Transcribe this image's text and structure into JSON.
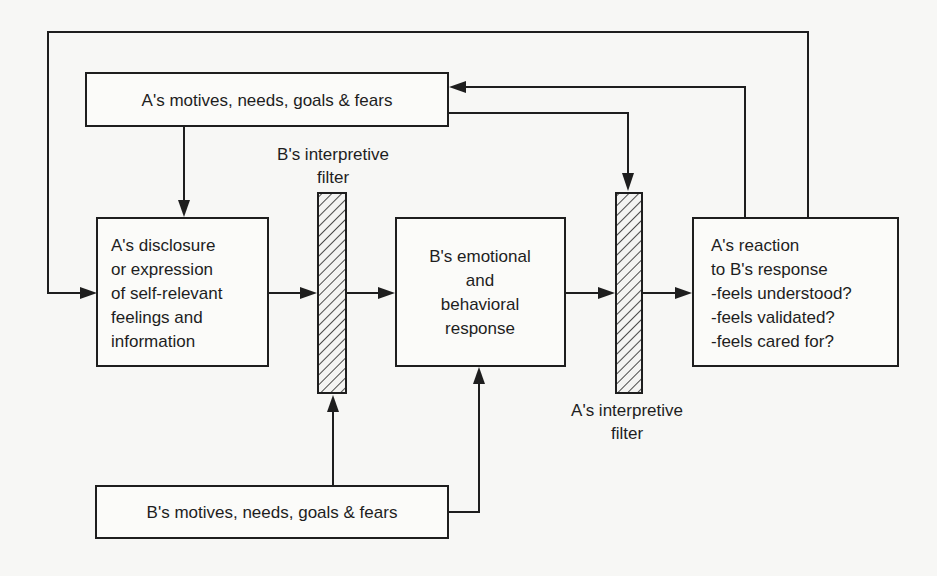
{
  "diagram": {
    "nodes": {
      "a_motives": {
        "lines": [
          "A's  motives,  needs,  goals & fears"
        ]
      },
      "a_disclosure": {
        "lines": [
          "A's  disclosure",
          "or  expression",
          "of  self-relevant",
          "feelings  and",
          "information"
        ]
      },
      "b_response": {
        "lines": [
          "B's  emotional",
          "and",
          "behavioral",
          "response"
        ]
      },
      "a_reaction": {
        "lines": [
          "A's  reaction",
          "to  B's  response",
          "-feels  understood?",
          "-feels  validated?",
          "-feels  cared for?"
        ]
      },
      "b_motives": {
        "lines": [
          "B's  motives,  needs,  goals & fears"
        ]
      }
    },
    "filters": {
      "b_filter": {
        "label_lines": [
          "B's  interpretive",
          "filter"
        ]
      },
      "a_filter": {
        "label_lines": [
          "A's  interpretive",
          "filter"
        ]
      }
    },
    "edges": [
      {
        "from": "a_motives",
        "to": "a_disclosure"
      },
      {
        "from": "a_disclosure",
        "to": "b_filter"
      },
      {
        "from": "b_filter",
        "to": "b_response"
      },
      {
        "from": "b_response",
        "to": "a_filter"
      },
      {
        "from": "a_filter",
        "to": "a_reaction"
      },
      {
        "from": "b_motives",
        "to": "b_filter"
      },
      {
        "from": "b_motives",
        "to": "b_response"
      },
      {
        "from": "a_motives",
        "to": "a_filter"
      },
      {
        "from": "a_reaction",
        "to": "a_motives"
      },
      {
        "from": "a_reaction",
        "to": "a_disclosure"
      }
    ]
  }
}
